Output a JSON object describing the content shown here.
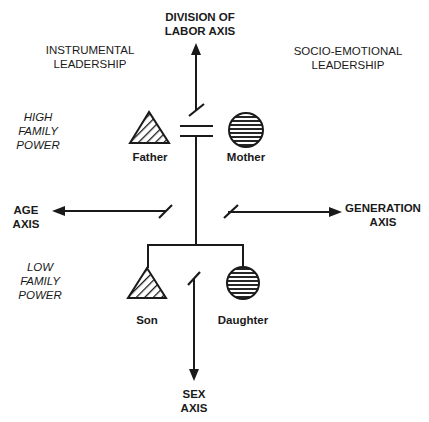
{
  "diagram": {
    "axes": {
      "division_of_labor": {
        "label": "DIVISION OF\nLABOR AXIS",
        "direction": "up"
      },
      "age": {
        "label": "AGE\nAXIS",
        "direction": "left"
      },
      "generation": {
        "label": "GENERATION\nAXIS",
        "direction": "right"
      },
      "sex": {
        "label": "SEX\nAXIS",
        "direction": "down"
      }
    },
    "quadrant_labels": {
      "instrumental": "INSTRUMENTAL\nLEADERSHIP",
      "socio_emotional": "SOCIO-EMOTIONAL\nLEADERSHIP",
      "high_power": "HIGH\nFAMILY\nPOWER",
      "low_power": "LOW\nFAMILY\nPOWER"
    },
    "members": [
      {
        "name": "Father",
        "symbol": "triangle-hatched"
      },
      {
        "name": "Mother",
        "symbol": "circle-lined"
      },
      {
        "name": "Son",
        "symbol": "triangle-hatched"
      },
      {
        "name": "Daughter",
        "symbol": "circle-lined"
      }
    ],
    "line_color": "#1a1a1a"
  }
}
